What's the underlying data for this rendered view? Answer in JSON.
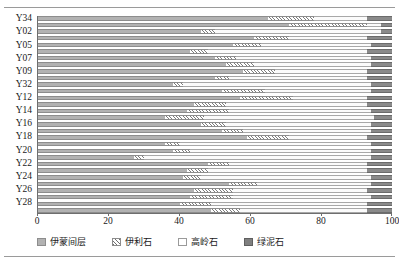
{
  "chart_data": {
    "type": "bar",
    "subtype": "stacked-horizontal-100-percent",
    "title": "",
    "xlabel": "",
    "ylabel": "",
    "xlim": [
      0,
      100
    ],
    "xticks": [
      0,
      20,
      40,
      60,
      80,
      100
    ],
    "grid": false,
    "legend_position": "bottom",
    "orientation": "horizontal",
    "categories": [
      "Y34",
      "",
      "Y02",
      "",
      "Y05",
      "",
      "Y07",
      "",
      "Y09",
      "",
      "Y32",
      "",
      "Y12",
      "",
      "Y14",
      "",
      "Y16",
      "",
      "Y18",
      "",
      "Y20",
      "",
      "Y22",
      "",
      "Y24",
      "",
      "Y26",
      "",
      "Y28",
      ""
    ],
    "visible_tick_labels": [
      "Y34",
      "Y02",
      "Y05",
      "Y07",
      "Y09",
      "Y32",
      "Y12",
      "Y14",
      "Y16",
      "Y18",
      "Y20",
      "Y22",
      "Y24",
      "Y26",
      "Y28"
    ],
    "series": [
      {
        "name": "伊蒙间层",
        "pattern": "solid-gray",
        "color": "#b2b2b2",
        "values": [
          65,
          71,
          46,
          61,
          55,
          43,
          50,
          53,
          58,
          50,
          38,
          52,
          57,
          44,
          42,
          36,
          46,
          52,
          59,
          36,
          38,
          27,
          48,
          42,
          41,
          54,
          44,
          43,
          40,
          49
        ]
      },
      {
        "name": "伊利石",
        "pattern": "diagonal-hatch",
        "color": "#ffffff",
        "values": [
          13,
          22,
          4,
          10,
          8,
          5,
          6,
          8,
          9,
          4,
          3,
          12,
          15,
          9,
          12,
          11,
          7,
          6,
          12,
          4,
          5,
          3,
          6,
          6,
          5,
          8,
          11,
          12,
          9,
          8
        ]
      },
      {
        "name": "高岭石",
        "pattern": "white",
        "color": "#fbfbfb",
        "values": [
          15,
          4,
          47,
          22,
          31,
          45,
          38,
          33,
          26,
          39,
          53,
          30,
          21,
          40,
          40,
          48,
          41,
          36,
          22,
          54,
          51,
          64,
          39,
          45,
          48,
          32,
          38,
          39,
          44,
          36
        ]
      },
      {
        "name": "绿泥石",
        "pattern": "solid-dark-gray",
        "color": "#8a8a8a",
        "values": [
          7,
          3,
          3,
          7,
          6,
          7,
          6,
          6,
          7,
          7,
          6,
          6,
          7,
          7,
          6,
          5,
          6,
          6,
          7,
          6,
          6,
          6,
          7,
          7,
          6,
          6,
          7,
          6,
          7,
          7
        ]
      }
    ]
  },
  "legend": {
    "items": [
      {
        "label": "伊蒙间层",
        "swatch": "legend-swatch-illite-smectite"
      },
      {
        "label": "伊利石",
        "swatch": "legend-swatch-illite"
      },
      {
        "label": "高岭石",
        "swatch": "legend-swatch-kaolinite"
      },
      {
        "label": "绿泥石",
        "swatch": "legend-swatch-chlorite"
      }
    ]
  }
}
